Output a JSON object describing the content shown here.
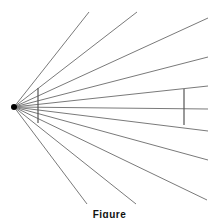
{
  "figure": {
    "type": "illusion-diagram",
    "focal_point": {
      "x": 14,
      "y": 107
    },
    "line_color": "#7a7a7a",
    "segment_color": "#555555",
    "rays": [
      {
        "x2": 89,
        "y2": 12
      },
      {
        "x2": 137,
        "y2": 12
      },
      {
        "x2": 208,
        "y2": 18
      },
      {
        "x2": 208,
        "y2": 57
      },
      {
        "x2": 208,
        "y2": 86
      },
      {
        "x2": 208,
        "y2": 109
      },
      {
        "x2": 208,
        "y2": 131
      },
      {
        "x2": 208,
        "y2": 160
      },
      {
        "x2": 207,
        "y2": 200
      },
      {
        "x2": 136,
        "y2": 204
      },
      {
        "x2": 87,
        "y2": 204
      }
    ],
    "vertical_segments": [
      {
        "x": 38,
        "y1": 88,
        "y2": 123
      },
      {
        "x": 184,
        "y1": 89,
        "y2": 125
      }
    ]
  },
  "caption": "Figure"
}
